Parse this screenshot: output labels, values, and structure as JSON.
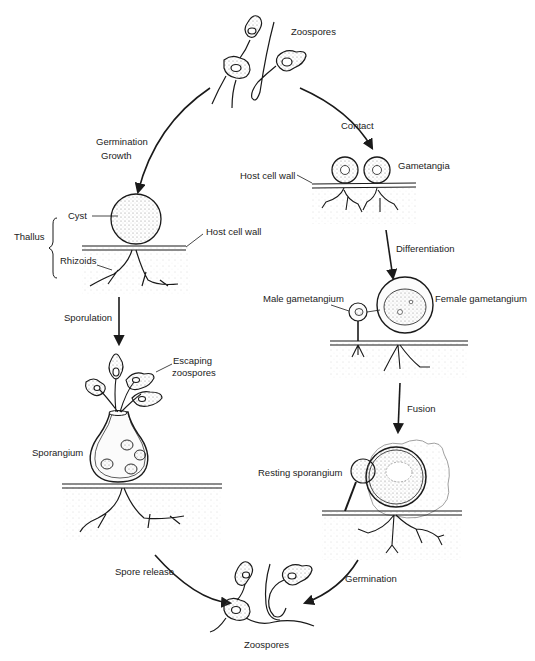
{
  "diagram": {
    "type": "life-cycle",
    "stages": {
      "top_zoospores": {
        "label": "Zoospores"
      },
      "thallus": {
        "group_label": "Thallus",
        "cyst_label": "Cyst",
        "rhizoids_label": "Rhizoids",
        "host_wall_label": "Host cell wall"
      },
      "sporangium": {
        "label": "Sporangium",
        "escaping_label_line1": "Escaping",
        "escaping_label_line2": "zoospores"
      },
      "gametangia": {
        "label": "Gametangia",
        "host_wall_label": "Host cell wall"
      },
      "differentiated": {
        "male_label": "Male gametangium",
        "female_label": "Female gametangium"
      },
      "resting": {
        "label": "Resting sporangium"
      },
      "bottom_zoospores": {
        "label": "Zoospores"
      }
    },
    "transitions": {
      "germination_line1": "Germination",
      "germination_line2": "Growth",
      "contact": "Contact",
      "sporulation": "Sporulation",
      "differentiation": "Differentiation",
      "fusion": "Fusion",
      "spore_release": "Spore release",
      "germination_final": "Germination"
    },
    "colors": {
      "ink": "#1a1a1a",
      "stipple": "#9a9a9a",
      "background": "#ffffff"
    }
  }
}
